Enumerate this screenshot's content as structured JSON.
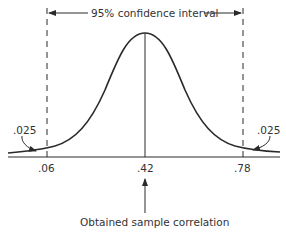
{
  "diagram": {
    "title": "95% confidence interval",
    "caption": "Obtained sample correlation",
    "tail_labels": {
      "left": ".025",
      "right": ".025"
    },
    "axis_ticks": [
      ".06",
      ".42",
      ".78"
    ],
    "confidence_level": "95%",
    "lower_bound": ".06",
    "sample_correlation": ".42",
    "upper_bound": ".78",
    "colors": {
      "line": "#2a2a2a",
      "text": "#333333",
      "background": "#ffffff"
    }
  }
}
